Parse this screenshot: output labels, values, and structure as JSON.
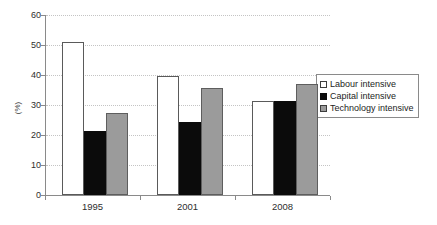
{
  "chart_data": {
    "type": "bar",
    "title": "",
    "xlabel": "",
    "ylabel": "(%)",
    "categories": [
      "1995",
      "2001",
      "2008"
    ],
    "series": [
      {
        "name": "Labour intensive",
        "values": [
          51.0,
          39.7,
          31.3
        ],
        "color": "#ffffff"
      },
      {
        "name": "Capital intensive",
        "values": [
          21.5,
          24.5,
          31.5
        ],
        "color": "#0b0b0b"
      },
      {
        "name": "Technology intensive",
        "values": [
          27.5,
          35.8,
          37.0
        ],
        "color": "#9b9b9b"
      }
    ],
    "ylim": [
      0,
      60
    ],
    "ytick_step": 10,
    "ytick_labels": [
      "0",
      "10",
      "20",
      "30",
      "40",
      "50",
      "60"
    ],
    "grid": true,
    "grid_axis": "y",
    "legend_position": "right-inside"
  },
  "axis": {
    "y_label": "(%)",
    "y_ticks": [
      "60",
      "50",
      "40",
      "30",
      "20",
      "10",
      "0"
    ],
    "x_ticks": [
      "1995",
      "2001",
      "2008"
    ]
  },
  "legend": {
    "items": [
      {
        "label": "Labour intensive"
      },
      {
        "label": "Capital intensive"
      },
      {
        "label": "Technology intensive"
      }
    ]
  }
}
